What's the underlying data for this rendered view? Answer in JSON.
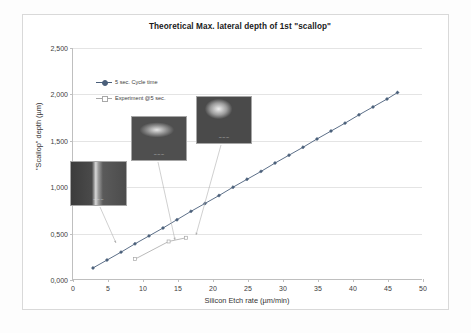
{
  "chart_data": {
    "type": "line",
    "title": "Theoretical Max. lateral depth of 1st \"scallop\"",
    "xlabel": "Silicon Etch rate (µm/min)",
    "ylabel": "\"Scallop\" depth (µm)",
    "xlim": [
      0,
      50
    ],
    "ylim": [
      0,
      2.5
    ],
    "xticks": [
      "0",
      "5",
      "10",
      "15",
      "20",
      "25",
      "30",
      "35",
      "40",
      "45",
      "50"
    ],
    "yticks": [
      "0,000",
      "0,500",
      "1,000",
      "1,500",
      "2,000",
      "2,500"
    ],
    "grid": "horizontal",
    "legend_position": "inside-upper-left",
    "series": [
      {
        "name": "5 sec. Cycle time",
        "color": "#4a5f7a",
        "marker": "diamond",
        "x": [
          3.0,
          5.0,
          7.0,
          9.0,
          11.0,
          13.0,
          15.0,
          17.0,
          19.0,
          21.0,
          23.0,
          25.0,
          27.0,
          29.0,
          31.0,
          33.0,
          35.0,
          37.0,
          39.0,
          41.0,
          43.0,
          45.0,
          46.5
        ],
        "y": [
          0.13,
          0.215,
          0.3,
          0.39,
          0.475,
          0.56,
          0.65,
          0.74,
          0.825,
          0.91,
          1.0,
          1.085,
          1.17,
          1.26,
          1.345,
          1.43,
          1.52,
          1.605,
          1.69,
          1.78,
          1.865,
          1.95,
          2.02
        ]
      },
      {
        "name": "Experiment @5 sec.",
        "color": "#a8a8a8",
        "marker": "square",
        "x": [
          9.0,
          13.8,
          16.3
        ],
        "y": [
          0.225,
          0.415,
          0.455
        ]
      }
    ]
  },
  "legend": {
    "items": [
      {
        "label": "5 sec. Cycle time",
        "color": "#4a5f7a"
      },
      {
        "label": "Experiment @5 sec.",
        "color": "#a8a8a8"
      }
    ]
  },
  "insets": [
    {
      "name": "sem-micrograph-low-rate",
      "scale_text": "—  —  —"
    },
    {
      "name": "sem-micrograph-mid-rate",
      "scale_text": "—  —  —"
    },
    {
      "name": "sem-micrograph-high-rate",
      "scale_text": "—  —  —"
    }
  ]
}
